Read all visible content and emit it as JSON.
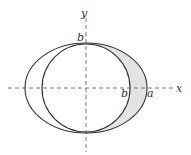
{
  "diagram": {
    "axes": {
      "x_label": "x",
      "y_label": "y",
      "style": "dashed"
    },
    "labels": {
      "top_b": "b",
      "circle_right_b": "b",
      "ellipse_right_a": "a"
    },
    "shapes": {
      "ellipse": {
        "semi_major": "a",
        "semi_minor": "b"
      },
      "circle": {
        "radius": "b"
      },
      "shaded_region": "right crescent between circle and ellipse"
    },
    "colors": {
      "stroke": "#333333",
      "axis": "#555555",
      "shade": "#e3e3e3",
      "background": "#ffffff"
    }
  }
}
